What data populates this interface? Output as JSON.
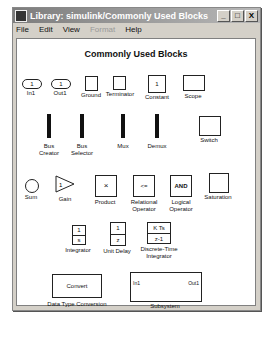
{
  "window": {
    "title": "Library: simulink/Commonly Used Blocks",
    "buttons": [
      "_",
      "□",
      "X"
    ]
  },
  "menu": [
    {
      "label": "File",
      "enabled": true
    },
    {
      "label": "Edit",
      "enabled": true
    },
    {
      "label": "View",
      "enabled": true
    },
    {
      "label": "Format",
      "enabled": false
    },
    {
      "label": "Help",
      "enabled": true
    }
  ],
  "heading": "Commonly Used Blocks",
  "blocks": {
    "in1": {
      "label": "In1",
      "value": "1"
    },
    "out1": {
      "label": "Out1",
      "value": "1"
    },
    "ground": {
      "label": "Ground"
    },
    "terminator": {
      "label": "Terminator"
    },
    "constant": {
      "label": "Constant",
      "value": "1"
    },
    "scope": {
      "label": "Scope"
    },
    "bus_creator": {
      "label1": "Bus",
      "label2": "Creator"
    },
    "bus_selector": {
      "label1": "Bus",
      "label2": "Selector"
    },
    "mux": {
      "label": "Mux"
    },
    "demux": {
      "label": "Demux"
    },
    "switch": {
      "label": "Switch"
    },
    "sum": {
      "label": "Sum"
    },
    "gain": {
      "label": "Gain",
      "value": "1"
    },
    "product": {
      "label": "Product",
      "symbol": "×"
    },
    "relational": {
      "label1": "Relational",
      "label2": "Operator",
      "symbol": "<="
    },
    "logical": {
      "label1": "Logical",
      "label2": "Operator",
      "symbol": "AND"
    },
    "saturation": {
      "label": "Saturation"
    },
    "integrator": {
      "label": "Integrator",
      "num": "1",
      "den": "s"
    },
    "unit_delay": {
      "label": "Unit Delay",
      "num": "1",
      "den": "z"
    },
    "dt_integrator": {
      "label1": "Discrete-Time",
      "label2": "Integrator",
      "num": "K Ts",
      "den": "z-1"
    },
    "convert": {
      "label": "Data Type Conversion",
      "text": "Convert"
    },
    "subsystem": {
      "label": "Subsystem",
      "in": "In1",
      "out": "Out1"
    }
  }
}
